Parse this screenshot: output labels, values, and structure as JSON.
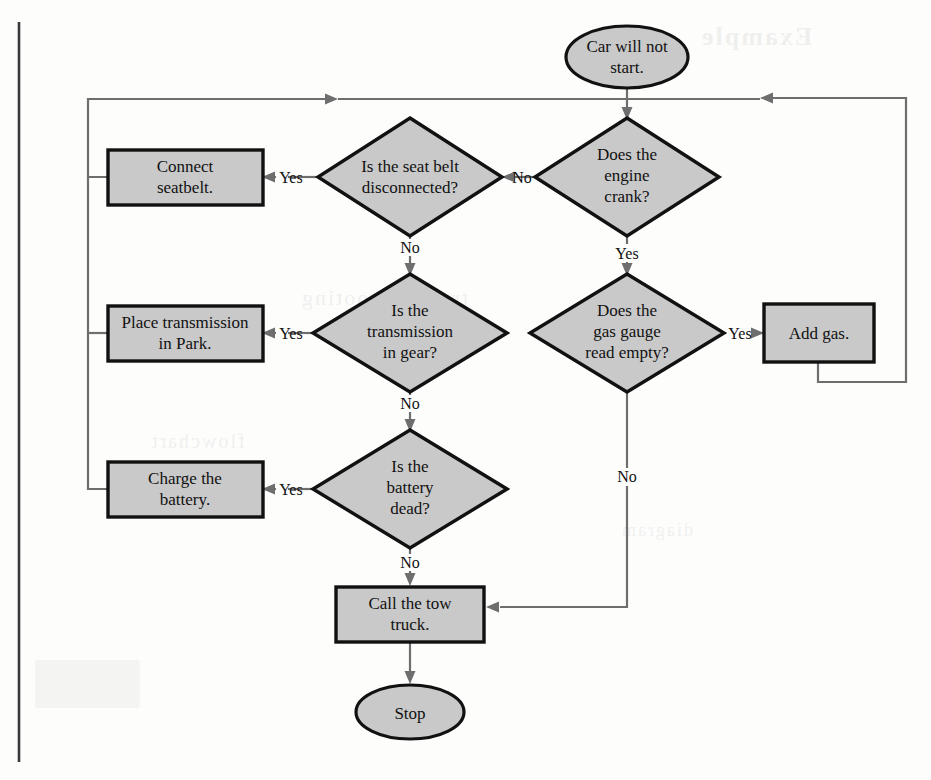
{
  "diagram": {
    "colors": {
      "shape_fill": "#c9c9c9",
      "shape_border": "#111111",
      "connector": "#6e6e6e",
      "text": "#111111",
      "background": "#fdfdfc",
      "page_edge": "#3a3a3a"
    },
    "nodes": [
      {
        "id": "start",
        "type": "terminator",
        "label": "Car will not\nstart.",
        "cx": 627,
        "cy": 57,
        "w": 122,
        "h": 62
      },
      {
        "id": "seatbelt_q",
        "type": "decision",
        "label": "Is the seat belt\ndisconnected?",
        "cx": 410,
        "cy": 177,
        "w": 184,
        "h": 118
      },
      {
        "id": "crank_q",
        "type": "decision",
        "label": "Does the\nengine\ncrank?",
        "cx": 627,
        "cy": 177,
        "w": 184,
        "h": 118
      },
      {
        "id": "connect_box",
        "type": "process",
        "label": "Connect\nseatbelt.",
        "cx": 185,
        "cy": 177,
        "w": 155,
        "h": 55
      },
      {
        "id": "trans_q",
        "type": "decision",
        "label": "Is the\ntransmission\nin gear?",
        "cx": 410,
        "cy": 333,
        "w": 194,
        "h": 118
      },
      {
        "id": "gas_q",
        "type": "decision",
        "label": "Does the\ngas gauge\nread empty?",
        "cx": 627,
        "cy": 333,
        "w": 194,
        "h": 118
      },
      {
        "id": "park_box",
        "type": "process",
        "label": "Place transmission\nin Park.",
        "cx": 185,
        "cy": 333,
        "w": 155,
        "h": 55
      },
      {
        "id": "addgas_box",
        "type": "process",
        "label": "Add gas.",
        "cx": 818,
        "cy": 333,
        "w": 110,
        "h": 58
      },
      {
        "id": "battery_q",
        "type": "decision",
        "label": "Is the\nbattery\ndead?",
        "cx": 410,
        "cy": 489,
        "w": 194,
        "h": 118
      },
      {
        "id": "charge_box",
        "type": "process",
        "label": "Charge the\nbattery.",
        "cx": 185,
        "cy": 489,
        "w": 155,
        "h": 55
      },
      {
        "id": "tow_box",
        "type": "process",
        "label": "Call the tow\ntruck.",
        "cx": 410,
        "cy": 614,
        "w": 148,
        "h": 55
      },
      {
        "id": "stop",
        "type": "terminator",
        "label": "Stop",
        "cx": 410,
        "cy": 712,
        "w": 108,
        "h": 54
      }
    ],
    "edge_labels": [
      {
        "id": "seatbelt_no",
        "text": "No",
        "x": 514,
        "y": 181
      },
      {
        "id": "seatbelt_yes",
        "text": "Yes",
        "x": 291,
        "y": 181
      },
      {
        "id": "seatbelt_down",
        "text": "No",
        "x": 410,
        "y": 248
      },
      {
        "id": "crank_yes",
        "text": "Yes",
        "x": 627,
        "y": 254
      },
      {
        "id": "trans_yes",
        "text": "Yes",
        "x": 291,
        "y": 337
      },
      {
        "id": "trans_down",
        "text": "No",
        "x": 410,
        "y": 404
      },
      {
        "id": "gas_yes",
        "text": "Yes",
        "x": 740,
        "y": 337
      },
      {
        "id": "gas_no",
        "text": "No",
        "x": 627,
        "y": 477
      },
      {
        "id": "battery_yes",
        "text": "Yes",
        "x": 291,
        "y": 493
      },
      {
        "id": "battery_down",
        "text": "No",
        "x": 410,
        "y": 563
      }
    ]
  },
  "bleed_text": {
    "b1": "Example",
    "b2": "troubleshooting",
    "b3": "flowchart",
    "b4": "diagram"
  }
}
